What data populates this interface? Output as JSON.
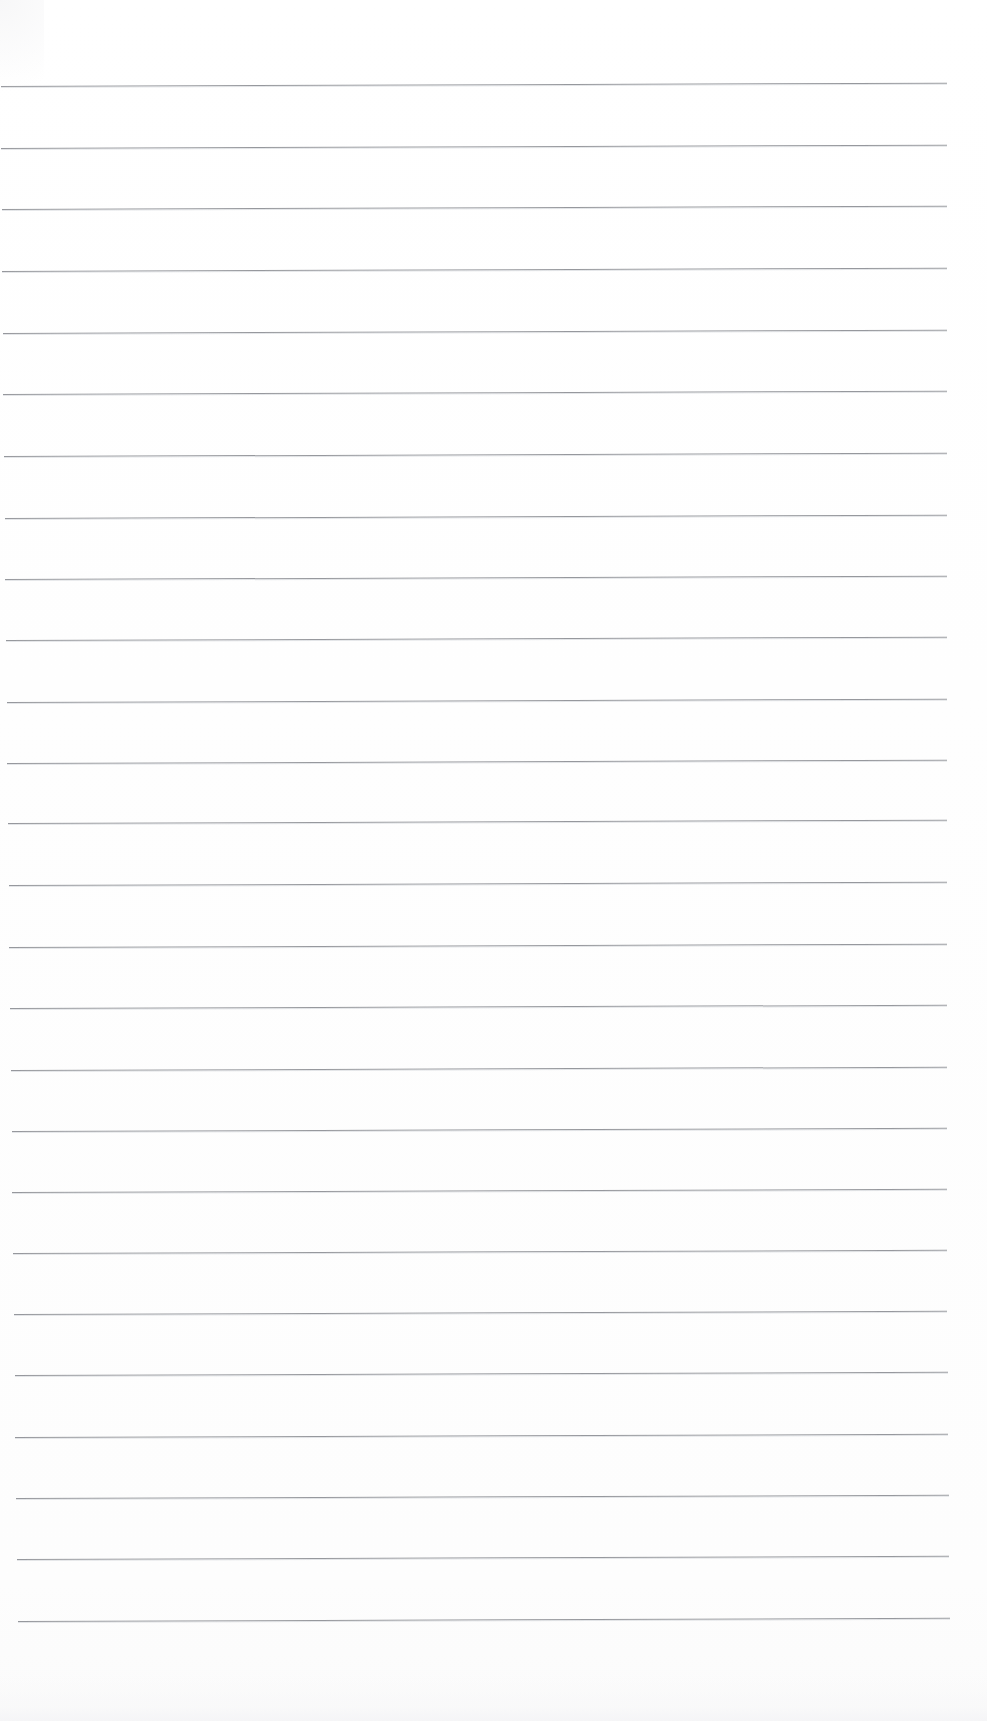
{
  "document": {
    "kind": "scanned-lined-notebook-page",
    "title": "Blank Lined Paper",
    "page_width": 987,
    "page_height": 1721,
    "background_color": "#fefefe",
    "has_visible_text": false,
    "has_handwriting": false,
    "has_margin_rule": false,
    "content_note": ""
  },
  "ruling": {
    "line_color": "#8e9095",
    "line_echo_color": "#c9ccd1",
    "line_thickness_px": 1,
    "line_count": 26,
    "first_line_y": 86,
    "line_spacing_px": 61.4,
    "right_end_x": 947,
    "tilt_degrees": -0.2,
    "left_start_x_top": 1,
    "left_start_x_bottom": 18
  },
  "margins": {
    "top_margin_px": 86,
    "bottom_margin_px": 100,
    "left_margin_px": 0,
    "right_margin_px": 40
  },
  "lines": [
    {
      "index": 1,
      "y": 86,
      "x_start": 1,
      "x_end": 947
    },
    {
      "index": 2,
      "y": 148,
      "x_start": 1,
      "x_end": 947
    },
    {
      "index": 3,
      "y": 209,
      "x_start": 2,
      "x_end": 947
    },
    {
      "index": 4,
      "y": 271,
      "x_start": 2,
      "x_end": 947
    },
    {
      "index": 5,
      "y": 333,
      "x_start": 3,
      "x_end": 947
    },
    {
      "index": 6,
      "y": 394,
      "x_start": 3,
      "x_end": 947
    },
    {
      "index": 7,
      "y": 456,
      "x_start": 4,
      "x_end": 947
    },
    {
      "index": 8,
      "y": 518,
      "x_start": 5,
      "x_end": 947
    },
    {
      "index": 9,
      "y": 579,
      "x_start": 5,
      "x_end": 947
    },
    {
      "index": 10,
      "y": 640,
      "x_start": 6,
      "x_end": 947
    },
    {
      "index": 11,
      "y": 702,
      "x_start": 7,
      "x_end": 947
    },
    {
      "index": 12,
      "y": 763,
      "x_start": 7,
      "x_end": 947
    },
    {
      "index": 13,
      "y": 823,
      "x_start": 8,
      "x_end": 947
    },
    {
      "index": 14,
      "y": 885,
      "x_start": 9,
      "x_end": 947
    },
    {
      "index": 15,
      "y": 947,
      "x_start": 9,
      "x_end": 947
    },
    {
      "index": 16,
      "y": 1008,
      "x_start": 10,
      "x_end": 947
    },
    {
      "index": 17,
      "y": 1070,
      "x_start": 11,
      "x_end": 947
    },
    {
      "index": 18,
      "y": 1131,
      "x_start": 12,
      "x_end": 947
    },
    {
      "index": 19,
      "y": 1192,
      "x_start": 12,
      "x_end": 947
    },
    {
      "index": 20,
      "y": 1253,
      "x_start": 13,
      "x_end": 947
    },
    {
      "index": 21,
      "y": 1314,
      "x_start": 14,
      "x_end": 947
    },
    {
      "index": 22,
      "y": 1375,
      "x_start": 15,
      "x_end": 948
    },
    {
      "index": 23,
      "y": 1437,
      "x_start": 15,
      "x_end": 948
    },
    {
      "index": 24,
      "y": 1498,
      "x_start": 16,
      "x_end": 949
    },
    {
      "index": 25,
      "y": 1559,
      "x_start": 17,
      "x_end": 949
    },
    {
      "index": 26,
      "y": 1621,
      "x_start": 18,
      "x_end": 950
    }
  ]
}
